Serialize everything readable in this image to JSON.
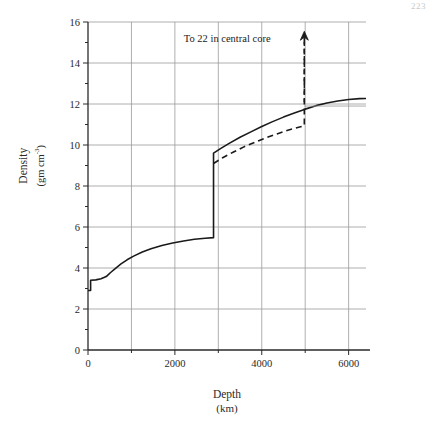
{
  "page": {
    "number": "223"
  },
  "chart_data": {
    "type": "line",
    "title": "",
    "xlabel": "Depth",
    "xlabel_unit": "(km)",
    "ylabel": "Density",
    "ylabel_unit": "(gm cm",
    "ylabel_unit_exponent": "-3",
    "ylabel_unit_close": ")",
    "xlim": [
      0,
      6400
    ],
    "ylim": [
      0,
      16
    ],
    "xticks": [
      0,
      1000,
      2000,
      3000,
      4000,
      5000,
      6000
    ],
    "xtick_labels": [
      "0",
      "",
      "2000",
      "",
      "4000",
      "",
      "6000"
    ],
    "yticks": [
      0,
      1,
      2,
      3,
      4,
      5,
      6,
      7,
      8,
      9,
      10,
      11,
      12,
      13,
      14,
      15,
      16
    ],
    "ytick_labels": [
      "0",
      "",
      "2",
      "",
      "4",
      "",
      "6",
      "",
      "8",
      "",
      "10",
      "",
      "12",
      "",
      "14",
      "",
      "16"
    ],
    "grid": true,
    "grid_x_values": [
      1000,
      2000,
      3000,
      4000,
      5000,
      6000
    ],
    "grid_y_values": [
      2,
      4,
      6,
      8,
      10,
      12,
      14,
      16
    ],
    "legend": "none",
    "annotations": [
      {
        "text": "To 22 in central core",
        "x": 4600,
        "y": 15.1,
        "arrow": "up-dashed"
      }
    ],
    "series": [
      {
        "name": "density-solid",
        "style": "solid",
        "color": "#1a1a1a",
        "points": [
          [
            0,
            2.9
          ],
          [
            60,
            2.9
          ],
          [
            60,
            3.4
          ],
          [
            180,
            3.42
          ],
          [
            300,
            3.48
          ],
          [
            420,
            3.58
          ],
          [
            520,
            3.78
          ],
          [
            620,
            3.96
          ],
          [
            760,
            4.2
          ],
          [
            900,
            4.4
          ],
          [
            1050,
            4.58
          ],
          [
            1250,
            4.78
          ],
          [
            1450,
            4.94
          ],
          [
            1700,
            5.1
          ],
          [
            1950,
            5.22
          ],
          [
            2200,
            5.32
          ],
          [
            2450,
            5.4
          ],
          [
            2700,
            5.45
          ],
          [
            2890,
            5.48
          ],
          [
            2890,
            9.6
          ],
          [
            3050,
            9.82
          ],
          [
            3250,
            10.08
          ],
          [
            3500,
            10.38
          ],
          [
            3750,
            10.64
          ],
          [
            4000,
            10.9
          ],
          [
            4250,
            11.14
          ],
          [
            4500,
            11.36
          ],
          [
            4750,
            11.56
          ],
          [
            5000,
            11.75
          ],
          [
            5250,
            11.92
          ],
          [
            5500,
            12.05
          ],
          [
            5750,
            12.15
          ],
          [
            6000,
            12.22
          ],
          [
            6250,
            12.26
          ],
          [
            6400,
            12.27
          ]
        ]
      },
      {
        "name": "density-dashed-alternative",
        "style": "dashed",
        "color": "#1a1a1a",
        "points": [
          [
            2890,
            9.1
          ],
          [
            3100,
            9.38
          ],
          [
            3350,
            9.66
          ],
          [
            3600,
            9.92
          ],
          [
            3850,
            10.14
          ],
          [
            4100,
            10.35
          ],
          [
            4350,
            10.54
          ],
          [
            4600,
            10.72
          ],
          [
            4850,
            10.87
          ],
          [
            4980,
            10.94
          ],
          [
            4980,
            15.4
          ]
        ]
      },
      {
        "name": "density-dashed-continuation",
        "style": "dashed-thin",
        "color": "#9a9a9a",
        "points": [
          [
            4980,
            11.9
          ],
          [
            5250,
            11.9
          ],
          [
            5600,
            11.9
          ],
          [
            6000,
            11.9
          ],
          [
            6400,
            11.9
          ]
        ]
      }
    ]
  }
}
